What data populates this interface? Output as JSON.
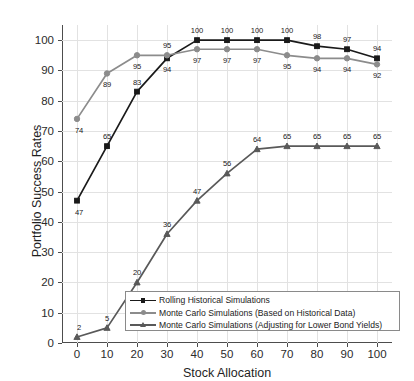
{
  "chart_data": {
    "type": "line",
    "title": "",
    "xlabel": "Stock Allocation",
    "ylabel": "Portfolio Success Rates",
    "x": [
      0,
      10,
      20,
      30,
      40,
      50,
      60,
      70,
      80,
      90,
      100
    ],
    "xlim": [
      -5,
      105
    ],
    "ylim": [
      0,
      105
    ],
    "xticks": [
      "0",
      "10",
      "20",
      "30",
      "40",
      "50",
      "60",
      "70",
      "80",
      "90",
      "100"
    ],
    "yticks": [
      "0",
      "10",
      "20",
      "30",
      "40",
      "50",
      "60",
      "70",
      "80",
      "90",
      "100"
    ],
    "grid": true,
    "legend_position": "lower-center",
    "series": [
      {
        "name": "Rolling Historical Simulations",
        "marker": "square",
        "color": "#1a1a1a",
        "values": [
          47,
          65,
          83,
          94,
          100,
          100,
          100,
          100,
          98,
          97,
          94
        ],
        "labels": [
          "47",
          "65",
          "83",
          "94",
          "100",
          "100",
          "100",
          "100",
          "98",
          "97",
          "94"
        ],
        "label_pos": [
          "below",
          "above",
          "above",
          "below",
          "above",
          "above",
          "above",
          "above",
          "above",
          "above",
          "above"
        ]
      },
      {
        "name": "Monte Carlo Simulations (Based on Historical Data)",
        "marker": "circle",
        "color": "#8c8c8c",
        "values": [
          74,
          89,
          95,
          95,
          97,
          97,
          97,
          95,
          94,
          94,
          92
        ],
        "labels": [
          "74",
          "89",
          "95",
          "95",
          "97",
          "97",
          "97",
          "95",
          "94",
          "94",
          "92"
        ],
        "label_pos": [
          "below",
          "below",
          "below",
          "above",
          "below",
          "below",
          "below",
          "below",
          "below",
          "below",
          "below"
        ]
      },
      {
        "name": "Monte Carlo Simulations (Adjusting for Lower Bond Yields)",
        "marker": "triangle",
        "color": "#595959",
        "values": [
          2,
          5,
          20,
          36,
          47,
          56,
          64,
          65,
          65,
          65,
          65
        ],
        "labels": [
          "2",
          "5",
          "20",
          "36",
          "47",
          "56",
          "64",
          "65",
          "65",
          "65",
          "65"
        ],
        "label_pos": [
          "above",
          "above",
          "above",
          "above",
          "above",
          "above",
          "above",
          "above",
          "above",
          "above",
          "above"
        ]
      }
    ]
  },
  "legend": {
    "items": [
      {
        "label": "Rolling Historical Simulations"
      },
      {
        "label": "Monte Carlo Simulations (Based on Historical Data)"
      },
      {
        "label": "Monte Carlo Simulations (Adjusting for Lower Bond Yields)"
      }
    ]
  }
}
